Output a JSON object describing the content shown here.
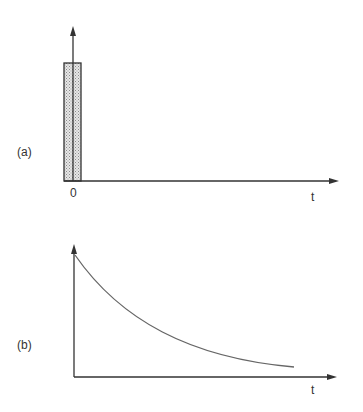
{
  "panel_a": {
    "label": "(a)",
    "origin_label": "0",
    "x_axis_label": "t",
    "description": "rectangular pulse at t=0 with upward arrow (impulse)"
  },
  "panel_b": {
    "label": "(b)",
    "x_axis_label": "t",
    "description": "exponentially decaying curve starting at t=0"
  },
  "colors": {
    "line": "#333333",
    "curve": "#666666",
    "pulse_fill": "#d8d8d8"
  }
}
